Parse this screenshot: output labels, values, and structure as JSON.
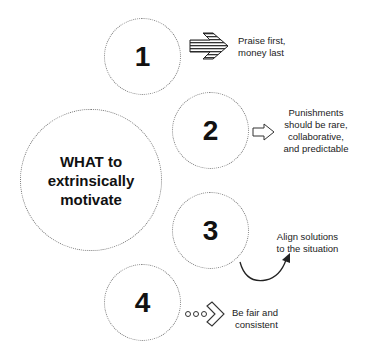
{
  "center": {
    "lines": [
      "WHAT to",
      "extrinsically",
      "motivate"
    ]
  },
  "items": [
    {
      "number": "1",
      "icon": "striped-arrow-icon",
      "lines": [
        "Praise first,",
        "money last"
      ]
    },
    {
      "number": "2",
      "icon": "outline-arrow-icon",
      "lines": [
        "Punishments",
        "should be rare,",
        "collaborative,",
        "and predictable"
      ]
    },
    {
      "number": "3",
      "icon": "curved-arrow-icon",
      "lines": [
        "Align solutions",
        "to the situation"
      ]
    },
    {
      "number": "4",
      "icon": "dotted-chevron-icon",
      "lines": [
        "Be fair and",
        "consistent"
      ]
    }
  ],
  "colors": {
    "text": "#111111",
    "circle_border": "#777777",
    "background": "#ffffff"
  }
}
